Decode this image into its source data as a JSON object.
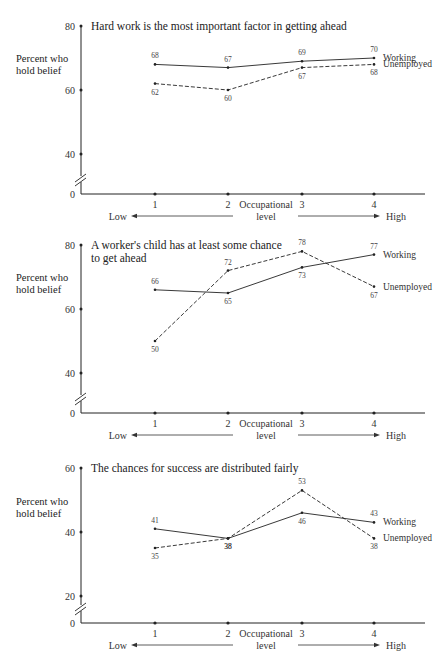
{
  "chart_data": [
    {
      "type": "line",
      "title": "Hard work is the most important factor in getting ahead",
      "ylabel": "Percent who hold belief",
      "xlabel": "Occupational level",
      "x_low_label": "Low",
      "x_high_label": "High",
      "categories": [
        "1",
        "2",
        "3",
        "4"
      ],
      "yticks": [
        0,
        40,
        60,
        80
      ],
      "ylim": [
        40,
        80
      ],
      "axis_break": true,
      "grid": false,
      "series": [
        {
          "name": "Working",
          "style": "solid",
          "values": [
            68,
            67,
            69,
            70
          ]
        },
        {
          "name": "Unemployed",
          "style": "dashed",
          "values": [
            62,
            60,
            67,
            68
          ]
        }
      ]
    },
    {
      "type": "line",
      "title": "A worker's child has at least some chance to get ahead",
      "title_lines": [
        "A worker's child has at least some chance",
        "to get ahead"
      ],
      "ylabel": "Percent who hold belief",
      "xlabel": "Occupational level",
      "x_low_label": "Low",
      "x_high_label": "High",
      "categories": [
        "1",
        "2",
        "3",
        "4"
      ],
      "yticks": [
        0,
        40,
        60,
        80
      ],
      "ylim": [
        40,
        80
      ],
      "axis_break": true,
      "grid": false,
      "series": [
        {
          "name": "Working",
          "style": "solid",
          "values": [
            66,
            65,
            73,
            77
          ]
        },
        {
          "name": "Unemployed",
          "style": "dashed",
          "values": [
            50,
            72,
            78,
            67
          ]
        }
      ]
    },
    {
      "type": "line",
      "title": "The chances for success are distributed fairly",
      "ylabel": "Percent who hold belief",
      "xlabel": "Occupational level",
      "x_low_label": "Low",
      "x_high_label": "High",
      "categories": [
        "1",
        "2",
        "3",
        "4"
      ],
      "yticks": [
        0,
        20,
        40,
        60
      ],
      "ylim": [
        20,
        60
      ],
      "axis_break": true,
      "grid": false,
      "series": [
        {
          "name": "Working",
          "style": "solid",
          "values": [
            41,
            38,
            46,
            43
          ]
        },
        {
          "name": "Unemployed",
          "style": "dashed",
          "values": [
            35,
            38,
            53,
            38
          ]
        }
      ]
    }
  ]
}
